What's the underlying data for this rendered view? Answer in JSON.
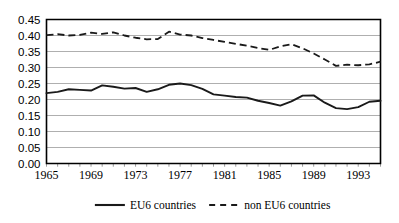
{
  "chart_data": {
    "type": "line",
    "title": "",
    "xlabel": "",
    "ylabel": "",
    "xlim": [
      1965,
      1995
    ],
    "ylim": [
      0.0,
      0.45
    ],
    "grid": true,
    "legend_position": "bottom",
    "x": [
      1965,
      1966,
      1967,
      1968,
      1969,
      1970,
      1971,
      1972,
      1973,
      1974,
      1975,
      1976,
      1977,
      1978,
      1979,
      1980,
      1981,
      1982,
      1983,
      1984,
      1985,
      1986,
      1987,
      1988,
      1989,
      1990,
      1991,
      1992,
      1993,
      1994,
      1995
    ],
    "xtick_labels": [
      "1965",
      "1969",
      "1973",
      "1977",
      "1981",
      "1985",
      "1989",
      "1993"
    ],
    "xticks": [
      1965,
      1969,
      1973,
      1977,
      1981,
      1985,
      1989,
      1993
    ],
    "ytick_labels": [
      "0.00",
      "0.05",
      "0.10",
      "0.15",
      "0.20",
      "0.25",
      "0.30",
      "0.35",
      "0.40",
      "0.45"
    ],
    "yticks": [
      0.0,
      0.05,
      0.1,
      0.15,
      0.2,
      0.25,
      0.3,
      0.35,
      0.4,
      0.45
    ],
    "series": [
      {
        "name": "EU6 countries",
        "style": "solid",
        "color": "#1a1a1a",
        "values": [
          0.22,
          0.224,
          0.232,
          0.23,
          0.228,
          0.244,
          0.24,
          0.234,
          0.236,
          0.224,
          0.232,
          0.246,
          0.25,
          0.245,
          0.233,
          0.216,
          0.212,
          0.208,
          0.206,
          0.196,
          0.189,
          0.181,
          0.194,
          0.212,
          0.213,
          0.211,
          0.22,
          0.206,
          0.201,
          0.2,
          0.203
        ]
      },
      {
        "name": "non EU6 countries",
        "style": "dashed",
        "color": "#1a1a1a",
        "values": [
          0.401,
          0.404,
          0.4,
          0.402,
          0.409,
          0.405,
          0.41,
          0.4,
          0.393,
          0.388,
          0.389,
          0.412,
          0.403,
          0.4,
          0.392,
          0.386,
          0.38,
          0.374,
          0.368,
          0.361,
          0.355,
          0.366,
          0.373,
          0.36,
          0.344,
          0.325,
          0.305,
          0.309,
          0.307,
          0.31,
          0.318
        ]
      }
    ],
    "series_extra_note": "EU6 solid series continues: 1990 0.190, 1991 0.173, 1992 0.170, 1993 0.176, 1994 0.193, 1995 0.196"
  },
  "legend": {
    "items": [
      {
        "label": "EU6 countries",
        "style": "solid"
      },
      {
        "label": "non EU6 countries",
        "style": "dashed"
      }
    ]
  }
}
